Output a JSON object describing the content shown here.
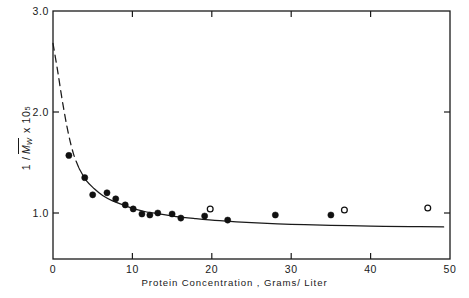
{
  "chart_data": {
    "type": "scatter",
    "title": "",
    "subtitle": "",
    "xlabel": "Protein  Concentration , Grams/ Liter",
    "ylabel": "1 / M̄w  x 10⁵",
    "ylabel_parts": {
      "prefix": "1 /",
      "symbol": "M",
      "symbol_subscript": "W",
      "multiplier": "x 10",
      "exponent": "5"
    },
    "xlim": [
      0,
      50
    ],
    "ylim": [
      0.6,
      3.0
    ],
    "xticks": [
      0,
      10,
      20,
      30,
      40,
      50
    ],
    "xtick_labels": [
      "0",
      "10",
      "20",
      "30",
      "40",
      "50"
    ],
    "yticks": [
      1.0,
      2.0,
      3.0
    ],
    "ytick_labels": [
      "1.0",
      "2.0",
      "3.0"
    ],
    "grid": false,
    "legend": "none",
    "frame": "box",
    "tick_direction": "in",
    "series": [
      {
        "name": "filled-circles",
        "marker": "filled-circle",
        "color": "#111111",
        "points": [
          {
            "x": 2.0,
            "y": 1.57
          },
          {
            "x": 4.0,
            "y": 1.35
          },
          {
            "x": 5.0,
            "y": 1.18
          },
          {
            "x": 6.8,
            "y": 1.2
          },
          {
            "x": 7.9,
            "y": 1.14
          },
          {
            "x": 9.1,
            "y": 1.08
          },
          {
            "x": 10.1,
            "y": 1.04
          },
          {
            "x": 11.2,
            "y": 0.99
          },
          {
            "x": 12.2,
            "y": 0.98
          },
          {
            "x": 13.2,
            "y": 1.0
          },
          {
            "x": 15.0,
            "y": 0.99
          },
          {
            "x": 16.1,
            "y": 0.95
          },
          {
            "x": 19.1,
            "y": 0.97
          },
          {
            "x": 22.0,
            "y": 0.93
          },
          {
            "x": 28.0,
            "y": 0.98
          },
          {
            "x": 35.0,
            "y": 0.98
          }
        ]
      },
      {
        "name": "open-circles",
        "marker": "open-circle",
        "color": "#111111",
        "points": [
          {
            "x": 19.8,
            "y": 1.04
          },
          {
            "x": 36.7,
            "y": 1.03
          },
          {
            "x": 47.2,
            "y": 1.05
          }
        ]
      }
    ],
    "curves": [
      {
        "name": "extrapolated-dashed-segment",
        "style": "dashed",
        "points": [
          {
            "x": 0.0,
            "y": 2.68
          },
          {
            "x": 0.6,
            "y": 2.4
          },
          {
            "x": 1.2,
            "y": 2.1
          },
          {
            "x": 1.9,
            "y": 1.8
          },
          {
            "x": 2.6,
            "y": 1.58
          },
          {
            "x": 3.3,
            "y": 1.44
          }
        ]
      },
      {
        "name": "fitted-solid-curve",
        "style": "solid",
        "points": [
          {
            "x": 3.3,
            "y": 1.44
          },
          {
            "x": 4.2,
            "y": 1.32
          },
          {
            "x": 5.2,
            "y": 1.24
          },
          {
            "x": 6.3,
            "y": 1.17
          },
          {
            "x": 7.5,
            "y": 1.12
          },
          {
            "x": 8.8,
            "y": 1.08
          },
          {
            "x": 10.2,
            "y": 1.04
          },
          {
            "x": 11.8,
            "y": 1.01
          },
          {
            "x": 13.5,
            "y": 0.99
          },
          {
            "x": 15.5,
            "y": 0.965
          },
          {
            "x": 18.0,
            "y": 0.945
          },
          {
            "x": 21.0,
            "y": 0.925
          },
          {
            "x": 25.0,
            "y": 0.905
          },
          {
            "x": 30.0,
            "y": 0.888
          },
          {
            "x": 35.0,
            "y": 0.878
          },
          {
            "x": 40.0,
            "y": 0.87
          },
          {
            "x": 45.0,
            "y": 0.865
          },
          {
            "x": 49.2,
            "y": 0.862
          }
        ]
      }
    ]
  }
}
